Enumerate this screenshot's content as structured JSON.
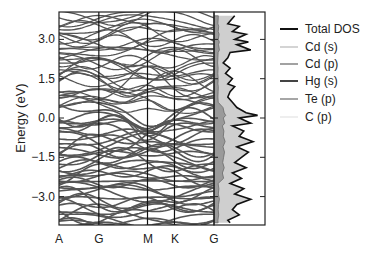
{
  "chart_data": {
    "type": "line",
    "title": "",
    "panels": [
      {
        "name": "band-structure",
        "xlabel": "",
        "ylabel": "Energy (eV)",
        "ylim": [
          -4.0,
          3.9
        ],
        "yticks": [
          3.0,
          1.5,
          0.0,
          -1.5,
          -3.0
        ],
        "ytick_labels": [
          "3.0",
          "1.5",
          "0.0",
          "−1.5",
          "−3.0"
        ],
        "kpath_labels": [
          "A",
          "G",
          "M",
          "K",
          "G"
        ],
        "kpath_positions": [
          0.0,
          0.257,
          0.571,
          0.745,
          1.0
        ],
        "band_color": "#555555",
        "note": "Dense band structure with many bands; valence bands dense below ~0.3 eV, conduction bands more spread above"
      },
      {
        "name": "density-of-states",
        "xlabel": "",
        "ylabel": "",
        "ylim": [
          -4.0,
          3.9
        ],
        "series": [
          {
            "name": "Total DOS",
            "color": "#111111"
          },
          {
            "name": "Cd (s)",
            "color": "#b0b0b0"
          },
          {
            "name": "Cd (p)",
            "color": "#808080"
          },
          {
            "name": "Hg (s)",
            "color": "#444444"
          },
          {
            "name": "Te (p)",
            "color": "#777777"
          },
          {
            "name": "C (p)",
            "color": "#dddddd"
          }
        ],
        "total_dos_profile": {
          "energy": [
            3.9,
            3.6,
            3.5,
            3.3,
            3.2,
            3.0,
            2.9,
            2.8,
            2.6,
            2.5,
            2.3,
            2.1,
            1.9,
            1.7,
            1.5,
            1.3,
            1.2,
            1.0,
            0.8,
            0.6,
            0.4,
            0.2,
            0.1,
            0.0,
            -0.2,
            -0.3,
            -0.5,
            -0.7,
            -0.9,
            -1.1,
            -1.3,
            -1.5,
            -1.7,
            -1.9,
            -2.1,
            -2.3,
            -2.5,
            -2.7,
            -2.9,
            -3.1,
            -3.3,
            -3.5,
            -3.7,
            -3.9,
            -4.0
          ],
          "value": [
            0.45,
            0.3,
            0.55,
            0.4,
            0.7,
            0.45,
            0.75,
            0.5,
            0.8,
            0.35,
            0.3,
            0.2,
            0.35,
            0.25,
            0.4,
            0.3,
            0.45,
            0.35,
            0.3,
            0.4,
            0.5,
            0.7,
            0.95,
            0.55,
            0.8,
            0.4,
            0.65,
            0.55,
            0.85,
            0.5,
            0.75,
            0.6,
            0.45,
            0.7,
            0.4,
            0.6,
            0.35,
            0.65,
            0.45,
            0.8,
            0.5,
            0.4,
            0.55,
            0.3,
            0.35
          ]
        },
        "shaded_region_color": "#cfcfcf"
      }
    ],
    "legend": {
      "position": "right",
      "entries": [
        "Total DOS",
        "Cd (s)",
        "Cd (p)",
        "Hg (s)",
        "Te (p)",
        "C (p)"
      ]
    },
    "grid": false
  },
  "axes": {
    "ylabel": "Energy (eV)",
    "yticks": [
      "3.0",
      "1.5",
      "0.0",
      "−1.5",
      "−3.0"
    ],
    "xticks": [
      "A",
      "G",
      "M",
      "K",
      "G"
    ]
  },
  "legend": {
    "items": [
      {
        "label": "Total DOS",
        "color": "#111111",
        "width": 2
      },
      {
        "label": "Cd (s)",
        "color": "#b8b8b8",
        "width": 1.2
      },
      {
        "label": "Cd (p)",
        "color": "#7a7a7a",
        "width": 1.4
      },
      {
        "label": "Hg (s)",
        "color": "#444444",
        "width": 2
      },
      {
        "label": "Te (p)",
        "color": "#808080",
        "width": 1.4
      },
      {
        "label": "C (p)",
        "color": "#e2e2e2",
        "width": 1.2
      }
    ]
  }
}
